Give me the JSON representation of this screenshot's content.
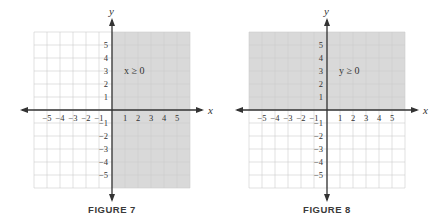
{
  "figures": [
    {
      "caption": "FIGURE 7",
      "inequality": "x ≥ 0",
      "x_axis_label": "x",
      "y_axis_label": "y",
      "shaded_region": "right half-plane (x ≥ 0)"
    },
    {
      "caption": "FIGURE 8",
      "inequality": "y ≥ 0",
      "x_axis_label": "x",
      "y_axis_label": "y",
      "shaded_region": "upper half-plane (y ≥ 0)"
    }
  ],
  "chart_data": [
    {
      "type": "area",
      "title": "FIGURE 7",
      "annotation": "x ≥ 0",
      "xlabel": "x",
      "ylabel": "y",
      "x_ticks": [
        -5,
        -4,
        -3,
        -2,
        -1,
        1,
        2,
        3,
        4,
        5
      ],
      "y_ticks": [
        -5,
        -4,
        -3,
        -2,
        -1,
        1,
        2,
        3,
        4,
        5
      ],
      "xlim": [
        -6,
        6
      ],
      "ylim": [
        -6,
        6
      ],
      "grid": true,
      "shaded": {
        "inequality": "x >= 0",
        "x_range": [
          0,
          6
        ],
        "y_range": [
          -6,
          6
        ]
      },
      "shade_color": "#d9d9d9"
    },
    {
      "type": "area",
      "title": "FIGURE 8",
      "annotation": "y ≥ 0",
      "xlabel": "x",
      "ylabel": "y",
      "x_ticks": [
        -5,
        -4,
        -3,
        -2,
        -1,
        1,
        2,
        3,
        4,
        5
      ],
      "y_ticks": [
        -5,
        -4,
        -3,
        -2,
        -1,
        1,
        2,
        3,
        4,
        5
      ],
      "xlim": [
        -6,
        6
      ],
      "ylim": [
        -6,
        6
      ],
      "grid": true,
      "shaded": {
        "inequality": "y >= 0",
        "x_range": [
          -6,
          6
        ],
        "y_range": [
          0,
          6
        ]
      },
      "shade_color": "#d9d9d9"
    }
  ],
  "colors": {
    "shade": "#d9d9d9",
    "grid": "#cfcfcf",
    "axis": "#333333"
  }
}
